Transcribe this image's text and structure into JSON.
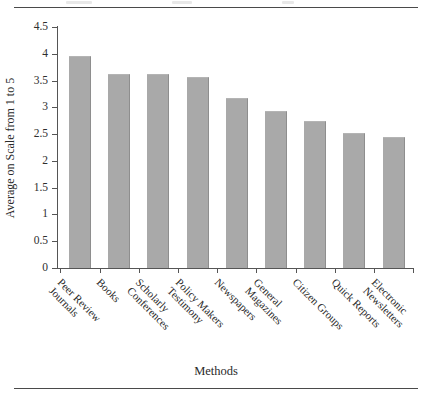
{
  "chart_data": {
    "type": "bar",
    "title": "",
    "xlabel": "Methods",
    "ylabel": "Average on Scale from 1 to 5",
    "ylim": [
      0,
      4.5
    ],
    "yticks": [
      "0",
      "0.5",
      "1",
      "1.5",
      "2",
      "2.5",
      "3",
      "3.5",
      "4",
      "4.5"
    ],
    "ytick_values": [
      0,
      0.5,
      1,
      1.5,
      2,
      2.5,
      3,
      3.5,
      4,
      4.5
    ],
    "grid": false,
    "legend": "none",
    "categories": [
      "Peer Review Journals",
      "Books",
      "Scholarly Conferences",
      "Policy Makers Testimony",
      "Newspapers",
      "General Magazines",
      "Citizen Groups",
      "Quick Reports",
      "Electronic Newsletters"
    ],
    "category_lines": [
      [
        "Peer Review",
        "Journals"
      ],
      [
        "Books"
      ],
      [
        "Scholarly",
        "Conferences"
      ],
      [
        "Policy Makers",
        "Testimony"
      ],
      [
        "Newspapers"
      ],
      [
        "General",
        "Magazines"
      ],
      [
        "Citizen Groups"
      ],
      [
        "Quick Reports"
      ],
      [
        "Electronic",
        "Newsletters"
      ]
    ],
    "values": [
      3.95,
      3.63,
      3.63,
      3.57,
      3.18,
      2.93,
      2.74,
      2.52,
      2.45
    ],
    "bar_color": "#a9a9a9",
    "axis_color": "#555555"
  },
  "figure": {
    "rule_color": "#4a4a4a"
  }
}
